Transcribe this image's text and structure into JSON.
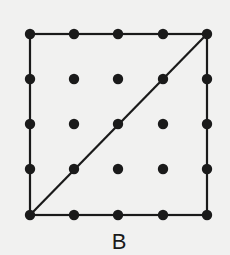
{
  "figure": {
    "label": "B",
    "grid": {
      "rows": 5,
      "cols": 5,
      "x_positions": [
        30,
        74,
        118,
        163,
        207
      ],
      "y_positions": [
        34,
        79,
        124,
        169,
        215
      ],
      "dot_radius": 5.2
    },
    "square": {
      "x1": 30,
      "y1": 34,
      "x2": 207,
      "y2": 215
    },
    "diagonal": {
      "from": [
        30,
        215
      ],
      "to": [
        207,
        34
      ]
    },
    "colors": {
      "ink": "#1a1a1a",
      "background": "#f1f1f0"
    }
  }
}
